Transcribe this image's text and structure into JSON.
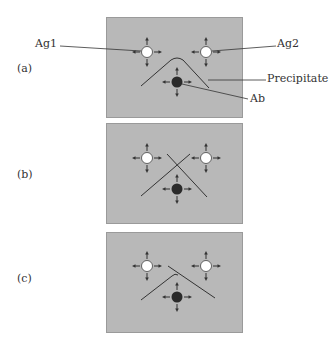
{
  "figure": {
    "panels": [
      {
        "label": "(a)",
        "pattern": "identity"
      },
      {
        "label": "(b)",
        "pattern": "non-identity"
      },
      {
        "label": "(c)",
        "pattern": "partial identity"
      }
    ],
    "callouts": {
      "ag1": "Ag1",
      "ag2": "Ag2",
      "precipitate": "Precipitate",
      "ab": "Ab"
    },
    "colors": {
      "gel": "#b8b8b8",
      "antigen_well": "#ffffff",
      "antibody_well": "#2a2a2a",
      "line": "#333333"
    }
  }
}
